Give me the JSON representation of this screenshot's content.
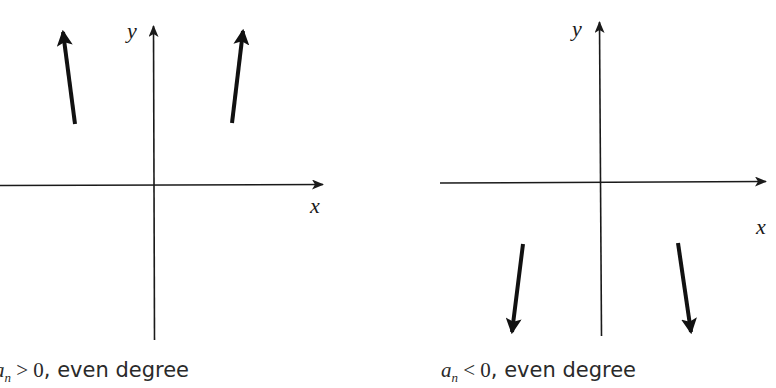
{
  "diagram": {
    "panels": [
      {
        "id": "positive",
        "caption": {
          "coef": "a",
          "coef_sub": "n",
          "relation": " > ",
          "value": "0",
          "rest": ", even degree"
        },
        "x_label": "x",
        "y_label": "y",
        "left_end_behavior": "up",
        "right_end_behavior": "up"
      },
      {
        "id": "negative",
        "caption": {
          "coef": "a",
          "coef_sub": "n",
          "relation": " < ",
          "value": "0",
          "rest": ", even degree"
        },
        "x_label": "x",
        "y_label": "y",
        "left_end_behavior": "down",
        "right_end_behavior": "down"
      }
    ]
  }
}
